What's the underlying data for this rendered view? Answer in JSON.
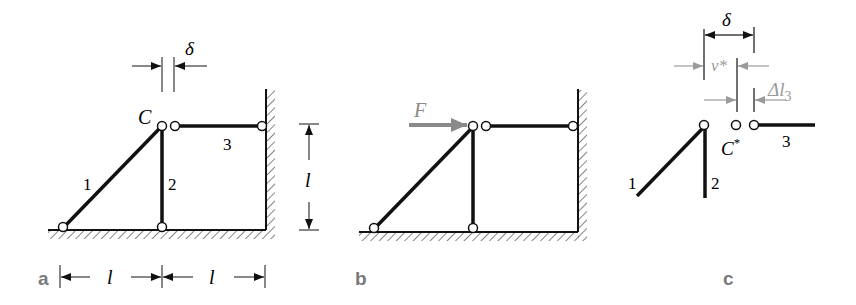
{
  "figure": {
    "panels": [
      {
        "id": "a",
        "label": "a",
        "node_label": "C",
        "gap_label": "δ",
        "bar_labels": [
          "1",
          "2",
          "3"
        ],
        "height_dim": "l",
        "width_dims": [
          "l",
          "l"
        ]
      },
      {
        "id": "b",
        "label": "b",
        "force_label": "F"
      },
      {
        "id": "c",
        "label": "c",
        "gap_label": "δ",
        "disp_label": "v*",
        "elong_label": "Δl",
        "elong_sub": "3",
        "node_label": "C",
        "node_sup": "*",
        "bar_labels": [
          "1",
          "2",
          "3"
        ]
      }
    ],
    "colors": {
      "bar": "#111111",
      "highlight": "#9a9a9a",
      "panel_label": "#7a7a7a"
    }
  }
}
